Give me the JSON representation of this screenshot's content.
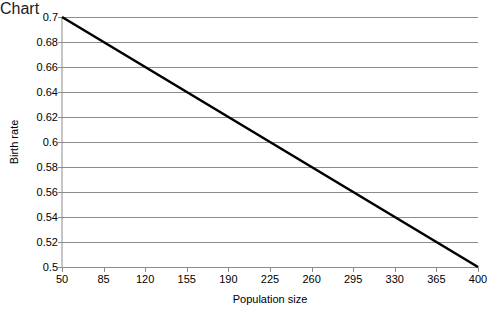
{
  "chart_data": {
    "type": "line",
    "title": "",
    "xlabel": "Population size",
    "ylabel": "Birth rate",
    "xlim": [
      50,
      400
    ],
    "ylim": [
      0.5,
      0.7
    ],
    "grid": true,
    "grid_axis": "y",
    "legend": false,
    "legend_position": "none",
    "x_ticks": [
      50,
      85,
      120,
      155,
      190,
      225,
      260,
      295,
      330,
      365,
      400
    ],
    "x_tick_labels": [
      "50",
      "85",
      "120",
      "155",
      "190",
      "225",
      "260",
      "295",
      "330",
      "365",
      "400"
    ],
    "y_ticks": [
      0.5,
      0.52,
      0.54,
      0.56,
      0.58,
      0.6,
      0.62,
      0.64,
      0.66,
      0.68,
      0.7
    ],
    "y_tick_labels": [
      "0.5",
      "0.52",
      "0.54",
      "0.56",
      "0.58",
      "0.6",
      "0.62",
      "0.64",
      "0.66",
      "0.68",
      "0.7"
    ],
    "series": [
      {
        "name": "Birth rate",
        "color": "#000000",
        "line_width": 2.6,
        "x": [
          50,
          85,
          120,
          155,
          190,
          225,
          260,
          295,
          330,
          365,
          400
        ],
        "values": [
          0.7,
          0.68,
          0.66,
          0.64,
          0.62,
          0.6,
          0.58,
          0.56,
          0.54,
          0.52,
          0.5
        ]
      }
    ],
    "annotations": []
  },
  "style": {
    "background": "#ffffff",
    "grid_color": "#8c8c8c",
    "axis_color": "#8c8c8c",
    "tick_color": "#8c8c8c",
    "text_color": "#000000"
  }
}
